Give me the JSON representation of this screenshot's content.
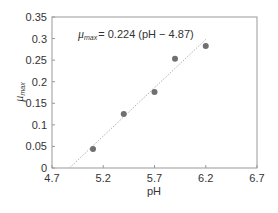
{
  "chart_data": {
    "type": "scatter",
    "title": "",
    "xlabel": "pH",
    "ylabel": "μmax",
    "ylabel_main": "μ",
    "ylabel_sub": "max",
    "xlim": [
      4.7,
      6.7
    ],
    "ylim": [
      0,
      0.35
    ],
    "x_ticks": [
      "4.7",
      "5.2",
      "5.7",
      "6.2",
      "6.7"
    ],
    "y_ticks": [
      "0",
      "0.05",
      "0.1",
      "0.15",
      "0.2",
      "0.25",
      "0.3",
      "0.35"
    ],
    "grid": false,
    "legend": null,
    "series": [
      {
        "name": "μmax observations",
        "type": "scatter",
        "color": "#707070",
        "x": [
          5.1,
          5.4,
          5.7,
          5.9,
          6.2
        ],
        "y": [
          0.044,
          0.125,
          0.176,
          0.253,
          0.283
        ]
      },
      {
        "name": "fit",
        "type": "line",
        "style": "dotted",
        "color": "#b0b0b0",
        "x": [
          4.87,
          6.2
        ],
        "y": [
          0,
          0.298
        ]
      }
    ],
    "annotations": [
      {
        "text": "μmax = 0.224 (pH − 4.87)",
        "mu": "μ",
        "sub": "max",
        "rest": "= 0.224 (pH − 4.87)",
        "x": 4.95,
        "y": 0.31
      }
    ]
  }
}
